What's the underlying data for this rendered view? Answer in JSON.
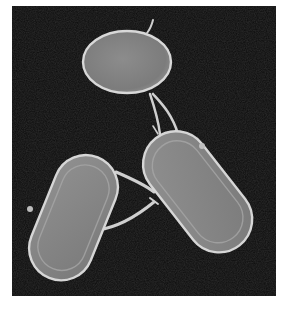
{
  "image": {
    "subject": "electron micrograph of three bacterial cells connected by filaments",
    "background_color": "#0b0b0b",
    "page_background": "#ffffff",
    "cell_fill": "#8e8e8e",
    "cell_edge": "#d8d8d8",
    "filament_color": "#cfcfcf",
    "cells": [
      {
        "name": "top-oval-cell",
        "shape": "oval",
        "position": "top-center"
      },
      {
        "name": "left-rod-cell",
        "shape": "rod",
        "position": "bottom-left"
      },
      {
        "name": "right-rod-cell",
        "shape": "rod",
        "position": "center-right"
      }
    ],
    "filaments": [
      {
        "name": "filament-top-to-right",
        "from": "top-oval-cell",
        "to": "right-rod-cell"
      },
      {
        "name": "filament-left-to-right-upper",
        "from": "left-rod-cell",
        "to": "right-rod-cell"
      },
      {
        "name": "filament-left-to-right-lower",
        "from": "left-rod-cell",
        "to": "right-rod-cell"
      }
    ]
  }
}
